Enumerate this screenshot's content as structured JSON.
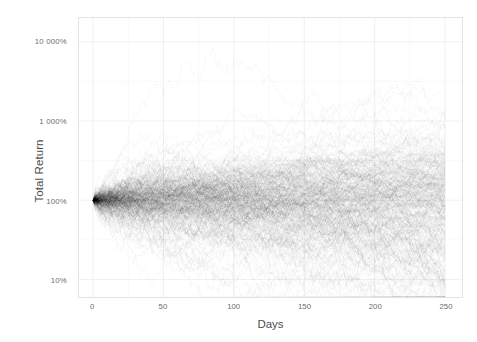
{
  "chart_data": {
    "type": "line",
    "title": "",
    "subtitle": "",
    "xlabel": "Days",
    "ylabel": "Total Return",
    "yscale": "log10",
    "xscale": "linear",
    "xlim": [
      -10,
      262
    ],
    "ylim_percent": [
      6,
      20000
    ],
    "grid": true,
    "legend": "none",
    "n_series": 400,
    "x_tick_labels": [
      "0",
      "50",
      "100",
      "150",
      "200",
      "250"
    ],
    "x_tick_values": [
      0,
      50,
      100,
      150,
      200,
      250
    ],
    "y_tick_labels": [
      "10%",
      "100%",
      "1 000%",
      "10 000%"
    ],
    "y_tick_values_percent": [
      10,
      100,
      1000,
      10000
    ],
    "series_color": "#000000",
    "series_alpha": 0.04,
    "start_value_percent": 100,
    "annotations": [],
    "quantiles": {
      "x": [
        0,
        10,
        25,
        50,
        75,
        100,
        125,
        150,
        175,
        200,
        225,
        250
      ],
      "p02": [
        100,
        72,
        58,
        45,
        36,
        29,
        25,
        22,
        20,
        19,
        18,
        17
      ],
      "p10": [
        100,
        83,
        72,
        62,
        55,
        50,
        47,
        45,
        44,
        44,
        44,
        45
      ],
      "p25": [
        100,
        92,
        86,
        80,
        77,
        75,
        75,
        76,
        78,
        80,
        83,
        86
      ],
      "p50": [
        100,
        101,
        103,
        106,
        110,
        115,
        120,
        126,
        132,
        139,
        146,
        154
      ],
      "p75": [
        100,
        111,
        123,
        140,
        157,
        176,
        194,
        213,
        233,
        254,
        276,
        299
      ],
      "p90": [
        100,
        122,
        146,
        185,
        226,
        272,
        318,
        367,
        419,
        474,
        533,
        596
      ],
      "p98": [
        100,
        142,
        190,
        285,
        390,
        520,
        650,
        800,
        960,
        1150,
        1350,
        1600
      ]
    },
    "notes": {
      "max_excursion_percent": 4000,
      "max_excursion_day": 107,
      "min_excursion_percent": 9,
      "min_excursion_day": 135
    }
  },
  "axes": {
    "y_title": "Total Return",
    "x_title": "Days",
    "y_ticks": [
      {
        "label": "10 000%",
        "value": 10000
      },
      {
        "label": "1 000%",
        "value": 1000
      },
      {
        "label": "100%",
        "value": 100
      },
      {
        "label": "10%",
        "value": 10
      }
    ],
    "x_ticks": [
      {
        "label": "0",
        "value": 0
      },
      {
        "label": "50",
        "value": 50
      },
      {
        "label": "100",
        "value": 100
      },
      {
        "label": "150",
        "value": 150
      },
      {
        "label": "200",
        "value": 200
      },
      {
        "label": "250",
        "value": 250
      }
    ]
  },
  "style": {
    "background": "#ffffff",
    "panel_border": "#e2e2e2",
    "grid_major": "#ececec",
    "grid_minor": "#f5f5f5",
    "tick_text": "#6d6d6d",
    "axis_title": "#4d4d4d",
    "line_color": "#000000"
  }
}
